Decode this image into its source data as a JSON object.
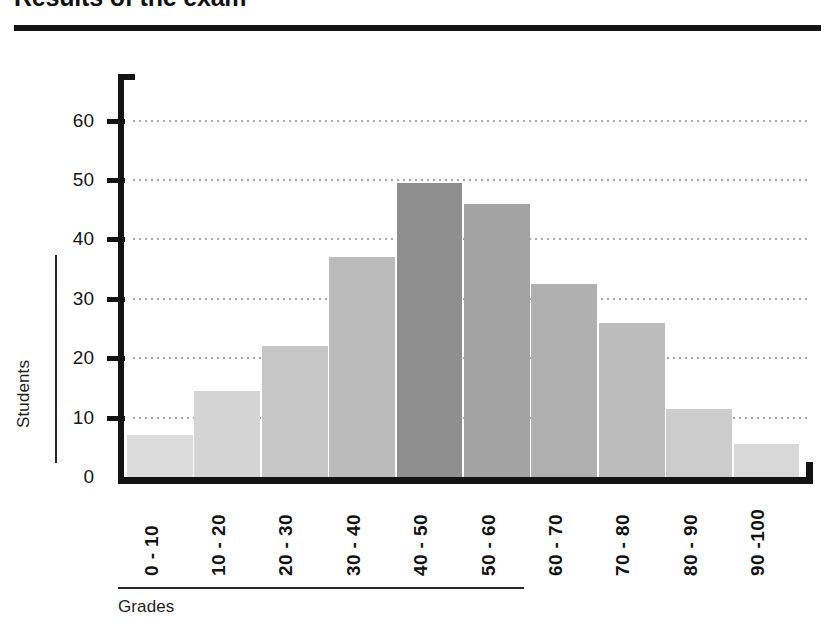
{
  "title": "Results of the exam",
  "axis_titles": {
    "x": "Grades",
    "y": "Students"
  },
  "y_ticks": [
    "0",
    "10",
    "20",
    "30",
    "40",
    "50",
    "60"
  ],
  "colors": {
    "axis": "#131313",
    "grid": "#2b2b2b",
    "text": "#161616",
    "background": "#ffffff"
  },
  "chart_data": {
    "type": "bar",
    "title": "Results of the exam",
    "subtitle": "",
    "xlabel": "Grades",
    "ylabel": "Students",
    "categories": [
      "0 - 10",
      "10 - 20",
      "20 - 30",
      "30 - 40",
      "40 - 50",
      "50 - 60",
      "60 - 70",
      "70 - 80",
      "80 - 90",
      "90 -100"
    ],
    "values": [
      7,
      14.5,
      22,
      37,
      49.5,
      46,
      32.5,
      26,
      11.5,
      5.5
    ],
    "bar_colors": [
      "#dcdcdc",
      "#d4d4d4",
      "#c6c6c6",
      "#bbbbbb",
      "#8f8f8f",
      "#a3a3a3",
      "#b0b0b0",
      "#bcbcbc",
      "#cccccc",
      "#d8d8d8"
    ],
    "ylim": [
      0,
      65
    ],
    "yticks": [
      0,
      10,
      20,
      30,
      40,
      50,
      60
    ],
    "grid": "horizontal-dotted",
    "legend": "none"
  }
}
